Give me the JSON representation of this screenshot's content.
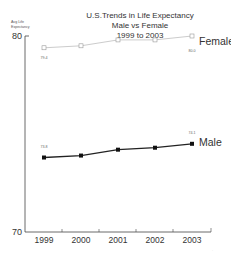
{
  "chart_data": {
    "type": "line",
    "title": "U.S.Trends in Life Expectancy",
    "subtitle_lines": [
      "Male vs Female",
      "1999 to 2003"
    ],
    "xlabel": "",
    "ylabel": "Avg Life Expectancy",
    "ylabel_lines": [
      "Avg Life",
      "Expectancy"
    ],
    "categories": [
      "1999",
      "2000",
      "2001",
      "2002",
      "2003"
    ],
    "ylim": [
      70,
      80
    ],
    "yticks": [
      "80",
      "70"
    ],
    "grid": false,
    "legend": "inline labels at right end of each series",
    "series": [
      {
        "name": "Female",
        "values": [
          79.4,
          79.5,
          79.8,
          79.8,
          80.0
        ],
        "marker": "open-square",
        "color": "#cccccc",
        "labels": {
          "first": "79.4",
          "last": "80.0"
        }
      },
      {
        "name": "Male",
        "values": [
          73.8,
          73.9,
          74.2,
          74.3,
          74.5
        ],
        "marker": "filled-square",
        "color": "#222222",
        "labels": {
          "first": "73.8",
          "last": "74.1"
        }
      }
    ]
  }
}
